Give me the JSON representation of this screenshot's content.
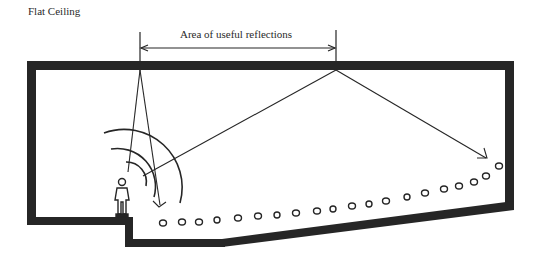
{
  "title": "Flat Ceiling",
  "annotation": {
    "label": "Area of useful reflections",
    "x_start": 140,
    "x_end": 336
  },
  "elements": {
    "room_section": "room-cross-section-with-flat-ceiling",
    "speaker": "person-figure-on-stage",
    "sound_waves": "concentric-arcs",
    "reflection_rays": [
      "near-reflection-to-front-seats",
      "far-reflection-to-rear-seats"
    ],
    "audience": "row-of-seat-circles"
  },
  "colors": {
    "ink": "#262626",
    "background": "#ffffff"
  }
}
